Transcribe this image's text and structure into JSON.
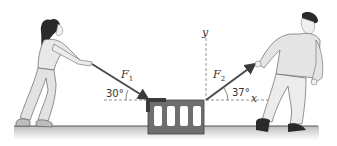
{
  "diagram": {
    "type": "physics-force-diagram",
    "forces": [
      {
        "label_base": "F",
        "label_sub": "1",
        "angle_label": "30°",
        "angle_deg": 30,
        "direction": "toward upper-left (pull by woman)"
      },
      {
        "label_base": "F",
        "label_sub": "2",
        "angle_label": "37°",
        "angle_deg": 37,
        "direction": "toward upper-right (pull by man)"
      }
    ],
    "axes": {
      "x_label": "x",
      "y_label": "y"
    },
    "colors": {
      "arrow": "#4a4a4a",
      "block": "#6e6e6e",
      "ground": "#555555",
      "dashed": "#777777",
      "figure_fill": "#e6e6e6",
      "figure_stroke": "#555555",
      "hair": "#2a2a2a"
    }
  }
}
